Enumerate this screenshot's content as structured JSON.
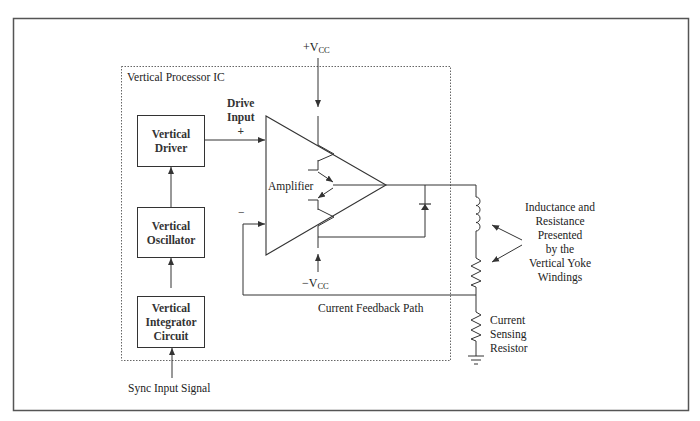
{
  "diagram": {
    "container_label": "Vertical Processor IC",
    "blocks": [
      {
        "id": "vertical-driver",
        "line1": "Vertical",
        "line2": "Driver"
      },
      {
        "id": "vertical-oscillator",
        "line1": "Vertical",
        "line2": "Oscillator"
      },
      {
        "id": "vertical-integrator",
        "line1": "Vertical",
        "line2": "Integrator",
        "line3": "Circuit"
      }
    ],
    "amplifier_label": "Amplifier",
    "drive_input": {
      "line1": "Drive",
      "line2": "Input",
      "sign": "+"
    },
    "inverting_input_sign": "−",
    "supply_positive": {
      "prefix": "+V",
      "sub": "CC"
    },
    "supply_negative": {
      "prefix": "−V",
      "sub": "CC"
    },
    "sync_input": "Sync Input Signal",
    "feedback_label": "Current Feedback Path",
    "yoke_annotation": [
      "Inductance and",
      "Resistance",
      "Presented",
      "by the",
      "Vertical Yoke",
      "Windings"
    ],
    "sense_resistor_label": [
      "Current",
      "Sensing",
      "Resistor"
    ],
    "colors": {
      "line": "#333333",
      "border": "#555555",
      "dashed": "#666666",
      "background": "#ffffff"
    }
  }
}
